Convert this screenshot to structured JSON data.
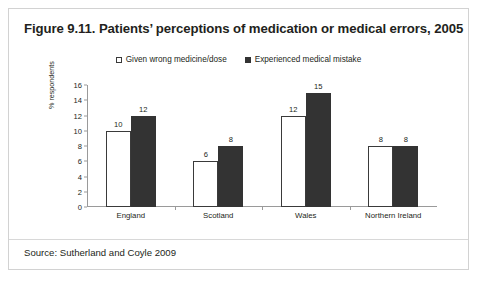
{
  "figure": {
    "title": "Figure 9.11. Patients’ perceptions of medication or medical errors, 2005",
    "source": "Source: Sutherland and Coyle 2009"
  },
  "chart_data": {
    "type": "bar",
    "title": "Figure 9.11. Patients’ perceptions of medication or medical errors, 2005",
    "categories": [
      "England",
      "Scotland",
      "Wales",
      "Northern Ireland"
    ],
    "series": [
      {
        "name": "Given wrong medicine/dose",
        "values": [
          10,
          6,
          12,
          8
        ],
        "color": "#ffffff",
        "border_color": "#3a3a3a",
        "marker": "open-square"
      },
      {
        "name": "Experienced medical mistake",
        "values": [
          12,
          8,
          15,
          8
        ],
        "color": "#333333",
        "border_color": "#333333",
        "marker": "filled-square"
      }
    ],
    "xlabel": "",
    "ylabel": "% respondents",
    "ylim": [
      0,
      16
    ],
    "ytick_step": 2,
    "yticks": [
      0,
      2,
      4,
      6,
      8,
      10,
      12,
      14,
      16
    ],
    "ytick_labels": [
      "0",
      "2",
      "4",
      "6",
      "8",
      "10",
      "12",
      "14",
      "16"
    ],
    "grid": false,
    "legend_position": "top-center",
    "data_labels": true
  }
}
